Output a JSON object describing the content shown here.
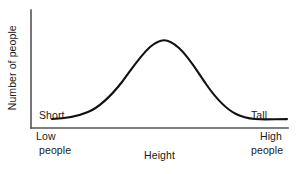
{
  "chart_data": {
    "type": "line",
    "title": "",
    "subtitle": "",
    "xlabel": "Height",
    "ylabel": "Number of people",
    "xtick_labels": [
      "Low",
      "High"
    ],
    "ytick_labels": [],
    "grid": false,
    "legend": null,
    "xlim": [
      0,
      1
    ],
    "ylim": [
      0,
      1
    ],
    "annotations": [
      {
        "id": "short",
        "line1": "Short",
        "line2": "people",
        "x": 0.08,
        "y": 0.33
      },
      {
        "id": "tall",
        "line1": "Tall",
        "line2": "people",
        "x": 0.9,
        "y": 0.33
      }
    ],
    "series": [
      {
        "name": "Height distribution",
        "color": "#111111",
        "x": [
          0.0,
          0.05,
          0.1,
          0.15,
          0.2,
          0.25,
          0.3,
          0.35,
          0.4,
          0.45,
          0.5,
          0.55,
          0.6,
          0.65,
          0.7,
          0.75,
          0.8,
          0.85,
          0.9,
          0.95,
          1.0
        ],
        "y": [
          0.02,
          0.02,
          0.03,
          0.05,
          0.1,
          0.19,
          0.33,
          0.52,
          0.72,
          0.9,
          1.0,
          0.97,
          0.85,
          0.66,
          0.46,
          0.28,
          0.15,
          0.07,
          0.04,
          0.02,
          0.02
        ]
      }
    ],
    "curve_path": "M 52 119 C 64 118.6 76 117 88 112 C 100 107 111 96 122 82 C 131 70 140 56 150 47 C 156 42 160 40.2 164 40.2 C 169 40.2 173 42.5 179 48 C 189 57 197 71 206 84 C 215 97 224 108 236 114 C 248 120 262 119.6 275 119.2 C 279 119.1 283 119.1 287 119.1",
    "axes": {
      "color": "#555555",
      "x_axis": {
        "x1": 31,
        "y1": 128,
        "x2": 288,
        "y2": 128
      },
      "y_axis": {
        "x1": 31,
        "y1": 10,
        "x2": 31,
        "y2": 128
      }
    },
    "colors": {
      "background": "#ffffff",
      "curve": "#111111",
      "axis": "#555555",
      "text": "#1a1a1a"
    }
  }
}
